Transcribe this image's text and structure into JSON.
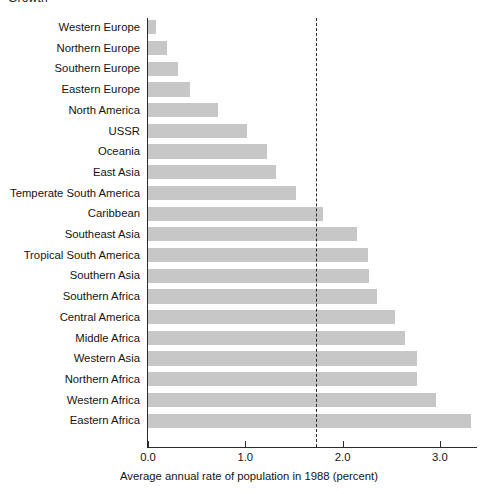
{
  "page": {
    "partial_heading": "Growth"
  },
  "chart_data": {
    "type": "bar",
    "orientation": "horizontal",
    "title": "",
    "xlabel": "Average annual rate of population in 1988 (percent)",
    "ylabel": "",
    "xlim": [
      0.0,
      3.4
    ],
    "xticks": [
      0.0,
      1.0,
      2.0,
      3.0
    ],
    "xtick_labels": [
      "0.0",
      "1.0",
      "2.0",
      "3.0"
    ],
    "grid": false,
    "legend": null,
    "bar_color": "#c7c7c7",
    "axis_color": "#2b2b2b",
    "reference_line": {
      "value": 1.73,
      "style": "dashed",
      "color": "#2b2b2b",
      "label": ""
    },
    "categories": [
      "Western Europe",
      "Northern Europe",
      "Southern Europe",
      "Eastern Europe",
      "North America",
      "USSR",
      "Oceania",
      "East Asia",
      "Temperate South America",
      "Caribbean",
      "Southeast Asia",
      "Tropical South America",
      "Southern Asia",
      "Southern Africa",
      "Central America",
      "Middle Africa",
      "Western Asia",
      "Northern Africa",
      "Western Africa",
      "Eastern Africa"
    ],
    "values": [
      0.08,
      0.2,
      0.31,
      0.43,
      0.72,
      1.02,
      1.22,
      1.32,
      1.52,
      1.8,
      2.15,
      2.26,
      2.27,
      2.35,
      2.54,
      2.64,
      2.76,
      2.76,
      2.96,
      3.32
    ]
  }
}
